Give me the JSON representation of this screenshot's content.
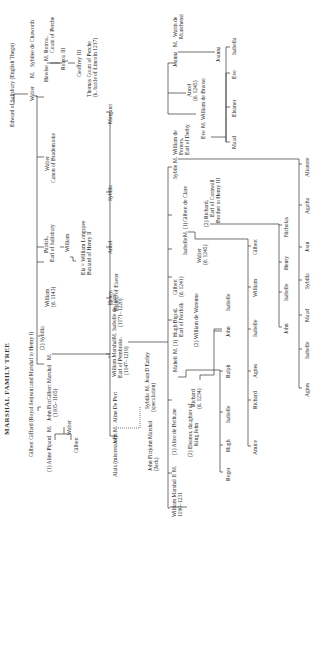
{
  "title": "MARSHAL FAMILY TREE",
  "people": {
    "edward": "Edward of Salisbury (English Thegn)",
    "walter_sib": "Walter",
    "m1": "M.",
    "sybil_chaworth": "Sybilee de Chaworth",
    "hawise": "Hawise",
    "m2": "M.",
    "rotrou": "Rotrou,",
    "rotrou2": "Count of Perche",
    "rotrou3": "Rotrou III",
    "geoffrey3": "Geoffrey III",
    "thomas1": "Thomas Count of Perche",
    "thomas2": "(k. battle of Lincoln 1217)",
    "walter_canon1": "Walter",
    "walter_canon2": "Canon of Bradenstoke",
    "patrick1": "Patrick,",
    "patrick2": "Earl of Salisbury",
    "william_sal": "William",
    "ela1": "Ela = William Longspee",
    "ela2": "Bastard of Henry II",
    "william_d1143a": "William",
    "william_d1143b": "(d. 1143)",
    "sybilla_wife": "(2) Sybilla",
    "gilbert_giffard": "Gilbert Giffard (Royal Serjeant and Marshal to Henry I)",
    "aline_pipard": "(1)  Aline Pipard",
    "m3": "M.",
    "john_fitz1": "John FitzGilbert Marshal",
    "john_fitz2": "(1105–1165)",
    "m4": "M.",
    "gilbert_son": "Gilbert",
    "walter_son": "Walter",
    "margaret": "Margaret",
    "sybilla_sis": "Sybilla",
    "ancel": "Ancel",
    "henry1": "Henry,",
    "henry2": "Bishop of Exeter",
    "wm_marshal1": "William Marshal",
    "wm_marshal2": "Earl of Pembroke,",
    "wm_marshal3": "(1147–1219)",
    "m5": "M.",
    "isabelle_clare1": "Isabelle de Clare",
    "isabelle_clare2": "(1171–1220)",
    "alais": "Alais (mistress of)",
    "john_bro": "John",
    "m6": "M.",
    "aline_port": "Aline De Port",
    "john_jack1": "John Fitzjohn Marshal",
    "john_jack2": "(Jack)",
    "sybilla_spec1": "Sybilla",
    "m7": "M.",
    "jean_earley": "Jean D'Earley",
    "sybilla_spec2": "(speculation)",
    "wm2_a": "William Marshal II",
    "wm2_b": "1190–1231",
    "m8": "M.",
    "alice_bethune": "(1)  Alice de Bethune",
    "eleanor1": "(2)  Eleanor, daughter of",
    "eleanor2": "King John",
    "richard_d1234a": "Richard",
    "richard_d1234b": "(d. 1234)",
    "maheli": "Maheli",
    "m9": "M. (1)",
    "hugh_bigod1": "Hugh Bigod,",
    "hugh_bigod2": "Earl of Norfolk",
    "warenne": "(2)  William de Warenne",
    "gilbert_d1241a": "Gilbert",
    "gilbert_d1241b": "(d. 1241)",
    "walter_d1245a": "Walter",
    "walter_d1245b": "(d. 1245)",
    "isabelle_m": "Isabelle",
    "m10": "M. (1)",
    "gilbert_clare": "Gilbert de Clare",
    "richard_corn1": "(2)  Richard,",
    "richard_corn2": "Earl of Cornwall",
    "richard_corn3": "Brother to Henry III",
    "sybile": "Sybile",
    "m11": "M.",
    "ferrers1": "William de",
    "ferrers2": "Ferrers,",
    "ferrers3": "Earl of Derby",
    "eve": "Eve",
    "m12": "M.",
    "braose": "William de Braose",
    "ancel2a": "Ancel",
    "ancel2b": "(d. 1245)",
    "joanna": "Joanna",
    "m13": "M.",
    "warin1": "Warin de",
    "warin2": "Munchensi",
    "bigod_kids": [
      "Roger",
      "Hugh",
      "Isabelle",
      "Ralph"
    ],
    "warenne_kids": [
      "John",
      "Isabelle"
    ],
    "clare_kids": [
      "Amice",
      "Richard",
      "Agnes",
      "Isabelle",
      "William",
      "Gilbert"
    ],
    "cornwall_kids": [
      "John",
      "Isabelle",
      "Henry",
      "Nicholas"
    ],
    "ferrers_kids": [
      "Agnes",
      "Isabelle",
      "Maud",
      "Sybilla",
      "Joan",
      "Agatha",
      "Alianore"
    ],
    "braose_kids": [
      "Maud",
      "Eleanor",
      "Eve",
      "Isabella"
    ],
    "joanna_kid": "Joanna"
  }
}
